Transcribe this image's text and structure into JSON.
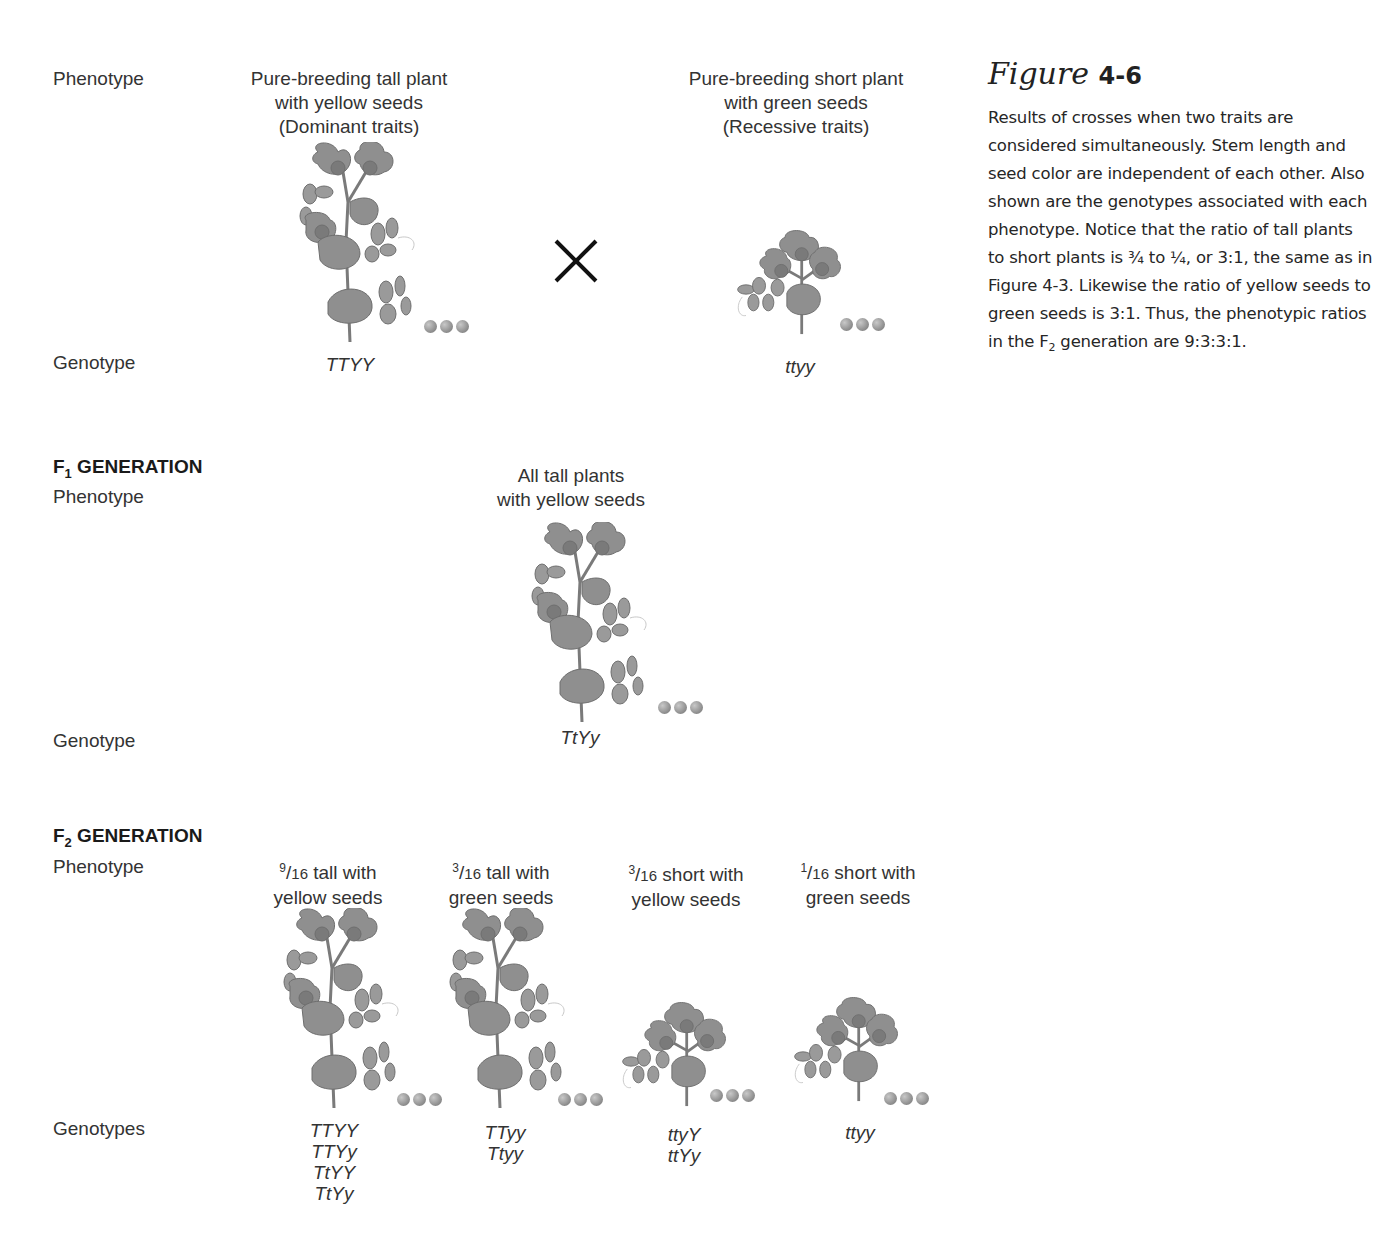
{
  "figure": {
    "title_script": "Figure",
    "title_number": "4-6",
    "caption_parts": [
      "Results of crosses when two traits are considered simultaneously. Stem length and seed color are independent of each other. Also shown are the genotypes associated with each phenotype. Notice that the ratio of tall plants to short plants is ¾ to ¼, or 3:1, the same as in Figure 4-3. Likewise the ratio of yellow seeds to green seeds is 3:1. Thus, the phenotypic ratios in the F",
      "2",
      " generation are 9:3:3:1."
    ]
  },
  "labels": {
    "phenotype": "Phenotype",
    "genotype": "Genotype",
    "genotypes": "Genotypes",
    "f1_prefix": "F",
    "f1_sub": "1",
    "f2_prefix": "F",
    "f2_sub": "2",
    "generation": " GENERATION"
  },
  "parents": {
    "cross_symbol": "cross-icon",
    "dominant": {
      "phenotype_lines": [
        "Pure-breeding tall plant",
        "with yellow seeds",
        "(Dominant traits)"
      ],
      "genotype": "TTYY",
      "stature": "tall",
      "seed_color": "yellow"
    },
    "recessive": {
      "phenotype_lines": [
        "Pure-breeding short plant",
        "with green seeds",
        "(Recessive traits)"
      ],
      "genotype": "ttyy",
      "stature": "short",
      "seed_color": "green"
    }
  },
  "f1": {
    "phenotype_lines": [
      "All tall plants",
      "with yellow seeds"
    ],
    "genotype": "TtYy",
    "stature": "tall"
  },
  "f2": [
    {
      "num": "9",
      "den": "16",
      "line1": " tall with",
      "line2": "yellow seeds",
      "genotypes": [
        "TTYY",
        "TTYy",
        "TtYY",
        "TtYy"
      ],
      "stature": "tall"
    },
    {
      "num": "3",
      "den": "16",
      "line1": " tall with",
      "line2": "green seeds",
      "genotypes": [
        "TTyy",
        "Ttyy"
      ],
      "stature": "tall"
    },
    {
      "num": "3",
      "den": "16",
      "line1": " short with",
      "line2": "yellow seeds",
      "genotypes": [
        "ttyY",
        "ttYy"
      ],
      "stature": "short"
    },
    {
      "num": "1",
      "den": "16",
      "line1": " short with",
      "line2": "green seeds",
      "genotypes": [
        "ttyy"
      ],
      "stature": "short"
    }
  ]
}
